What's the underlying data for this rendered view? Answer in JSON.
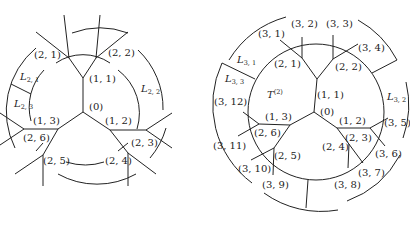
{
  "figures": [
    {
      "name": "left-tree-level-2",
      "root": "(0)",
      "level1": [
        "(1, 1)",
        "(1, 2)",
        "(1, 3)"
      ],
      "level2": [
        "(2, 1)",
        "(2, 2)",
        "(2, 3)",
        "(2, 4)",
        "(2, 5)",
        "(2, 6)"
      ],
      "arc_labels": {
        "L21": {
          "base": "L",
          "sub": "2, 1"
        },
        "L22": {
          "base": "L",
          "sub": "2, 2"
        },
        "L23": {
          "base": "L",
          "sub": "2, 3"
        }
      }
    },
    {
      "name": "right-tree-level-3",
      "root": "(0)",
      "tree_label": {
        "base": "T",
        "sup": "(2)"
      },
      "level1": [
        "(1, 1)",
        "(1, 2)",
        "(1, 3)"
      ],
      "level2": [
        "(2, 1)",
        "(2, 2)",
        "(2, 3)",
        "(2, 4)",
        "(2, 5)",
        "(2, 6)"
      ],
      "level3": [
        "(3, 1)",
        "(3, 2)",
        "(3, 3)",
        "(3, 4)",
        "(3, 5)",
        "(3, 6)",
        "(3, 7)",
        "(3, 8)",
        "(3, 9)",
        "(3, 10)",
        "(3, 11)",
        "(3, 12)"
      ],
      "arc_labels": {
        "L31": {
          "base": "L",
          "sub": "3, 1"
        },
        "L32": {
          "base": "L",
          "sub": "3, 2"
        },
        "L33": {
          "base": "L",
          "sub": "3, 3"
        }
      }
    }
  ]
}
